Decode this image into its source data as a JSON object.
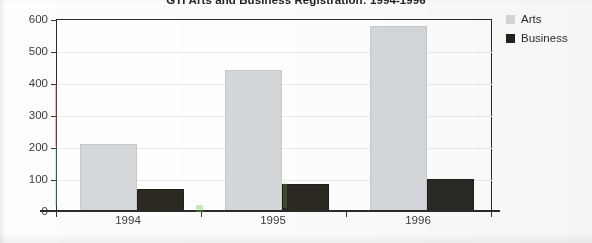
{
  "chart_data": {
    "type": "bar",
    "title": "GTI Arts and Business Registration: 1994-1996",
    "xlabel": "",
    "ylabel": "",
    "categories": [
      "1994",
      "1995",
      "1996"
    ],
    "series": [
      {
        "name": "Arts",
        "values": [
          210,
          440,
          578
        ],
        "color": "#d6d9dc"
      },
      {
        "name": "Business",
        "values": [
          70,
          85,
          100
        ],
        "color": "#2b2822"
      }
    ],
    "ylim": [
      0,
      600
    ],
    "yticks": [
      0,
      100,
      200,
      300,
      400,
      500,
      600
    ],
    "ytick_labels": [
      "0",
      "100",
      "200",
      "300",
      "400",
      "500",
      "600"
    ],
    "grid": true,
    "legend_position": "right"
  },
  "legend": {
    "entries": [
      {
        "label": "Arts"
      },
      {
        "label": "Business"
      }
    ]
  }
}
